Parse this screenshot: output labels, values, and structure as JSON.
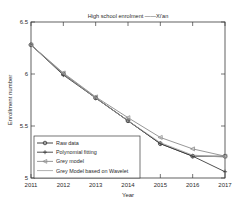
{
  "chart_data": {
    "type": "line",
    "title": "High school enrolment ——Xi'an",
    "xlabel": "Year",
    "ylabel": "Enrollment number",
    "x": [
      2011,
      2012,
      2013,
      2014,
      2015,
      2016,
      2017
    ],
    "xticklabels": [
      "2011",
      "2012",
      "2013",
      "2014",
      "2015",
      "2016",
      "2017"
    ],
    "yticklabels": [
      "5",
      "5.5",
      "6",
      "6.5"
    ],
    "yticks": [
      5,
      5.5,
      6,
      6.5
    ],
    "xlim": [
      2011,
      2017
    ],
    "ylim": [
      5,
      6.5
    ],
    "grid": false,
    "legend_position": "lower left",
    "series": [
      {
        "name": "Raw data",
        "marker": "circle",
        "color": "#303030",
        "values": [
          6.28,
          6.0,
          5.77,
          5.55,
          5.33,
          5.21,
          5.21
        ]
      },
      {
        "name": "Polynomial fitting",
        "marker": "plus",
        "color": "#3c3c3c",
        "values": [
          6.28,
          5.99,
          5.77,
          5.55,
          5.33,
          5.21,
          5.06
        ]
      },
      {
        "name": "Grey model",
        "marker": "left-triangle",
        "color": "#8c8c8c",
        "values": [
          6.28,
          6.01,
          5.78,
          5.58,
          5.39,
          5.28,
          5.21
        ]
      },
      {
        "name": "Grey Model based on Wavelet",
        "marker": "none",
        "color": "#9a9a9a",
        "values": [
          6.28,
          6.0,
          5.77,
          5.55,
          5.34,
          5.22,
          5.2
        ]
      }
    ]
  },
  "figure": {
    "background_color": "#ffffff",
    "axis_color": "#3a3a3a"
  }
}
